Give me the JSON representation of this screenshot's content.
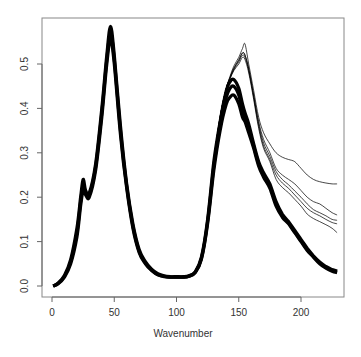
{
  "chart_data": {
    "type": "line",
    "title": "",
    "xlabel": "Wavenumber",
    "ylabel": "",
    "xlim": [
      -8,
      234
    ],
    "ylim": [
      -0.025,
      0.6
    ],
    "x_ticks": [
      0,
      50,
      100,
      150,
      200
    ],
    "y_ticks": [
      0.0,
      0.1,
      0.2,
      0.3,
      0.4,
      0.5
    ],
    "x_tick_labels": [
      "0",
      "50",
      "100",
      "150",
      "200"
    ],
    "y_tick_labels": [
      "0.0",
      "0.1",
      "0.2",
      "0.3",
      "0.4",
      "0.5"
    ],
    "grid": false,
    "legend": null,
    "line_color": "#000000",
    "x": [
      1,
      5,
      10,
      15,
      20,
      23,
      25,
      27,
      30,
      35,
      40,
      44,
      47,
      50,
      55,
      60,
      65,
      70,
      75,
      80,
      85,
      90,
      95,
      100,
      105,
      110,
      115,
      120,
      125,
      130,
      135,
      140,
      143,
      146,
      150,
      153,
      155,
      158,
      162,
      166,
      170,
      175,
      180,
      185,
      190,
      195,
      200,
      205,
      210,
      215,
      220,
      225,
      229
    ],
    "series": [
      {
        "name": "bundle-main-low",
        "values": [
          0.0,
          0.005,
          0.02,
          0.05,
          0.11,
          0.18,
          0.215,
          0.205,
          0.2,
          0.26,
          0.38,
          0.5,
          0.555,
          0.5,
          0.34,
          0.22,
          0.13,
          0.075,
          0.05,
          0.035,
          0.025,
          0.021,
          0.02,
          0.02,
          0.02,
          0.022,
          0.03,
          0.06,
          0.14,
          0.26,
          0.35,
          0.41,
          0.425,
          0.43,
          0.41,
          0.38,
          0.37,
          0.345,
          0.31,
          0.27,
          0.245,
          0.22,
          0.18,
          0.155,
          0.14,
          0.12,
          0.1,
          0.08,
          0.065,
          0.05,
          0.04,
          0.033,
          0.03
        ]
      },
      {
        "name": "bundle-main-mid",
        "values": [
          0.0,
          0.006,
          0.022,
          0.055,
          0.12,
          0.19,
          0.228,
          0.21,
          0.205,
          0.268,
          0.39,
          0.51,
          0.57,
          0.51,
          0.35,
          0.225,
          0.135,
          0.078,
          0.052,
          0.036,
          0.026,
          0.022,
          0.02,
          0.02,
          0.02,
          0.022,
          0.031,
          0.062,
          0.145,
          0.27,
          0.36,
          0.425,
          0.445,
          0.45,
          0.43,
          0.395,
          0.38,
          0.355,
          0.315,
          0.275,
          0.25,
          0.225,
          0.185,
          0.158,
          0.142,
          0.122,
          0.102,
          0.082,
          0.066,
          0.052,
          0.042,
          0.035,
          0.032
        ]
      },
      {
        "name": "bundle-main-high",
        "values": [
          0.0,
          0.007,
          0.024,
          0.06,
          0.13,
          0.2,
          0.24,
          0.215,
          0.21,
          0.275,
          0.4,
          0.52,
          0.585,
          0.52,
          0.36,
          0.23,
          0.14,
          0.082,
          0.055,
          0.038,
          0.028,
          0.023,
          0.021,
          0.021,
          0.021,
          0.023,
          0.032,
          0.065,
          0.15,
          0.28,
          0.37,
          0.44,
          0.46,
          0.465,
          0.445,
          0.41,
          0.39,
          0.365,
          0.32,
          0.28,
          0.255,
          0.23,
          0.19,
          0.162,
          0.145,
          0.125,
          0.105,
          0.085,
          0.068,
          0.054,
          0.044,
          0.037,
          0.034
        ]
      },
      {
        "name": "outlier-1",
        "values": [
          0.0,
          0.006,
          0.022,
          0.055,
          0.12,
          0.19,
          0.228,
          0.21,
          0.205,
          0.268,
          0.39,
          0.51,
          0.57,
          0.51,
          0.35,
          0.225,
          0.135,
          0.078,
          0.052,
          0.036,
          0.026,
          0.022,
          0.02,
          0.02,
          0.02,
          0.022,
          0.031,
          0.062,
          0.15,
          0.28,
          0.38,
          0.445,
          0.47,
          0.49,
          0.51,
          0.525,
          0.52,
          0.49,
          0.43,
          0.37,
          0.33,
          0.3,
          0.265,
          0.25,
          0.24,
          0.23,
          0.215,
          0.2,
          0.19,
          0.185,
          0.175,
          0.165,
          0.16
        ]
      },
      {
        "name": "outlier-2",
        "values": [
          0.0,
          0.006,
          0.022,
          0.055,
          0.12,
          0.19,
          0.228,
          0.21,
          0.205,
          0.268,
          0.39,
          0.51,
          0.57,
          0.51,
          0.35,
          0.225,
          0.135,
          0.078,
          0.052,
          0.036,
          0.026,
          0.022,
          0.02,
          0.02,
          0.02,
          0.022,
          0.031,
          0.062,
          0.15,
          0.28,
          0.38,
          0.445,
          0.472,
          0.495,
          0.515,
          0.535,
          0.545,
          0.5,
          0.44,
          0.38,
          0.345,
          0.32,
          0.3,
          0.29,
          0.285,
          0.28,
          0.265,
          0.25,
          0.24,
          0.235,
          0.232,
          0.23,
          0.23
        ]
      },
      {
        "name": "outlier-3",
        "values": [
          0.0,
          0.006,
          0.022,
          0.055,
          0.12,
          0.19,
          0.228,
          0.21,
          0.205,
          0.268,
          0.39,
          0.51,
          0.57,
          0.51,
          0.35,
          0.225,
          0.135,
          0.078,
          0.052,
          0.036,
          0.026,
          0.022,
          0.02,
          0.02,
          0.02,
          0.022,
          0.031,
          0.062,
          0.15,
          0.28,
          0.38,
          0.445,
          0.468,
          0.487,
          0.505,
          0.52,
          0.515,
          0.485,
          0.425,
          0.36,
          0.315,
          0.285,
          0.25,
          0.232,
          0.22,
          0.205,
          0.19,
          0.175,
          0.165,
          0.158,
          0.15,
          0.143,
          0.14
        ]
      },
      {
        "name": "outlier-4",
        "values": [
          0.0,
          0.006,
          0.022,
          0.055,
          0.12,
          0.19,
          0.228,
          0.21,
          0.205,
          0.268,
          0.39,
          0.51,
          0.57,
          0.51,
          0.35,
          0.225,
          0.135,
          0.078,
          0.052,
          0.036,
          0.026,
          0.022,
          0.02,
          0.02,
          0.02,
          0.022,
          0.031,
          0.062,
          0.15,
          0.28,
          0.38,
          0.445,
          0.466,
          0.485,
          0.5,
          0.515,
          0.51,
          0.48,
          0.42,
          0.355,
          0.31,
          0.28,
          0.24,
          0.222,
          0.21,
          0.195,
          0.18,
          0.162,
          0.152,
          0.145,
          0.138,
          0.13,
          0.12
        ]
      },
      {
        "name": "outlier-5",
        "values": [
          0.0,
          0.006,
          0.022,
          0.055,
          0.12,
          0.19,
          0.228,
          0.21,
          0.205,
          0.268,
          0.39,
          0.51,
          0.57,
          0.51,
          0.35,
          0.225,
          0.135,
          0.078,
          0.052,
          0.036,
          0.026,
          0.022,
          0.02,
          0.02,
          0.02,
          0.022,
          0.031,
          0.062,
          0.15,
          0.28,
          0.38,
          0.445,
          0.469,
          0.49,
          0.508,
          0.525,
          0.52,
          0.488,
          0.428,
          0.365,
          0.322,
          0.292,
          0.258,
          0.24,
          0.228,
          0.214,
          0.2,
          0.185,
          0.172,
          0.165,
          0.158,
          0.15,
          0.148
        ]
      }
    ]
  },
  "plot": {
    "x_axis_title": "Wavenumber",
    "frame_color": "#888888",
    "axis_color": "#666666"
  }
}
